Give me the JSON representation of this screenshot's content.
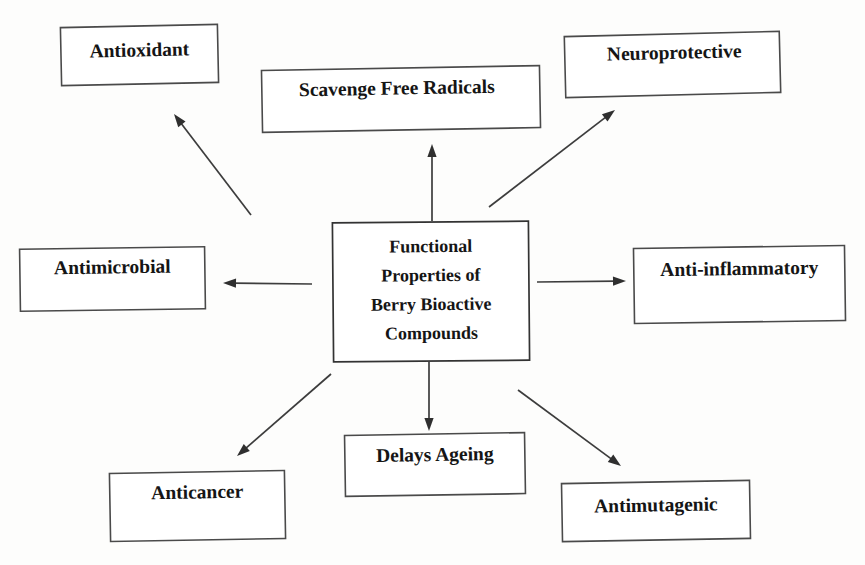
{
  "diagram": {
    "type": "hub-and-spoke concept map",
    "center": {
      "id": "center",
      "lines": [
        "Functional",
        "Properties of",
        "Berry Bioactive",
        "Compounds"
      ],
      "box": {
        "x": 333,
        "y": 222,
        "w": 196,
        "h": 139,
        "skew": -0.5
      },
      "text_color": "#151515",
      "border_color": "#333333",
      "fill": "#ffffff"
    },
    "nodes": [
      {
        "id": "antioxidant",
        "label": "Antioxidant",
        "box": {
          "x": 61,
          "y": 26,
          "w": 157,
          "h": 58,
          "skew": -1.2
        },
        "label_dx": 0,
        "label_dy": -3
      },
      {
        "id": "scavenge-free-radicals",
        "label": "Scavenge Free Radicals",
        "box": {
          "x": 262,
          "y": 68,
          "w": 278,
          "h": 62,
          "skew": -1.0
        },
        "label_dx": -4,
        "label_dy": -9
      },
      {
        "id": "neuroprotective",
        "label": "Neuroprotective",
        "box": {
          "x": 565,
          "y": 34,
          "w": 215,
          "h": 61,
          "skew": -1.4
        },
        "label_dx": 2,
        "label_dy": -10
      },
      {
        "id": "antimicrobial",
        "label": "Antimicrobial",
        "box": {
          "x": 20,
          "y": 248,
          "w": 185,
          "h": 62,
          "skew": -0.8
        },
        "label_dx": 0,
        "label_dy": -10
      },
      {
        "id": "anti-inflammatory",
        "label": "Anti-inflammatory",
        "box": {
          "x": 634,
          "y": 247,
          "w": 211,
          "h": 75,
          "skew": -0.8
        },
        "label_dx": 0,
        "label_dy": -14
      },
      {
        "id": "anticancer",
        "label": "Anticancer",
        "box": {
          "x": 110,
          "y": 472,
          "w": 175,
          "h": 68,
          "skew": -1.0
        },
        "label_dx": 0,
        "label_dy": -12
      },
      {
        "id": "delays-ageing",
        "label": "Delays Ageing",
        "box": {
          "x": 345,
          "y": 434,
          "w": 180,
          "h": 61,
          "skew": -0.9
        },
        "label_dx": 0,
        "label_dy": -8
      },
      {
        "id": "antimutagenic",
        "label": "Antimutagenic",
        "box": {
          "x": 562,
          "y": 482,
          "w": 188,
          "h": 58,
          "skew": -1.0
        },
        "label_dx": 0,
        "label_dy": -4
      }
    ],
    "edges": [
      {
        "id": "edge-to-antioxidant",
        "from": "center",
        "to": "antioxidant",
        "x1": 251,
        "y1": 215,
        "x2": 174,
        "y2": 114
      },
      {
        "id": "edge-to-scavenge-free-radicals",
        "from": "center",
        "to": "scavenge-free-radicals",
        "x1": 432,
        "y1": 221,
        "x2": 432,
        "y2": 144
      },
      {
        "id": "edge-to-neuroprotective",
        "from": "center",
        "to": "neuroprotective",
        "x1": 489,
        "y1": 207,
        "x2": 615,
        "y2": 110
      },
      {
        "id": "edge-to-antimicrobial",
        "from": "center",
        "to": "antimicrobial",
        "x1": 312,
        "y1": 284,
        "x2": 223,
        "y2": 283
      },
      {
        "id": "edge-to-anti-inflammatory",
        "from": "center",
        "to": "anti-inflammatory",
        "x1": 537,
        "y1": 282,
        "x2": 626,
        "y2": 281
      },
      {
        "id": "edge-to-anticancer",
        "from": "center",
        "to": "anticancer",
        "x1": 331,
        "y1": 374,
        "x2": 237,
        "y2": 456
      },
      {
        "id": "edge-to-delays-ageing",
        "from": "center",
        "to": "delays-ageing",
        "x1": 429,
        "y1": 362,
        "x2": 429,
        "y2": 431
      },
      {
        "id": "edge-to-antimutagenic",
        "from": "center",
        "to": "antimutagenic",
        "x1": 518,
        "y1": 390,
        "x2": 621,
        "y2": 466
      }
    ],
    "style": {
      "background": "#fdfdfc",
      "line_color": "#3d3d3d",
      "box_border_color": "#4a4a4a",
      "text_color": "#151515"
    }
  }
}
